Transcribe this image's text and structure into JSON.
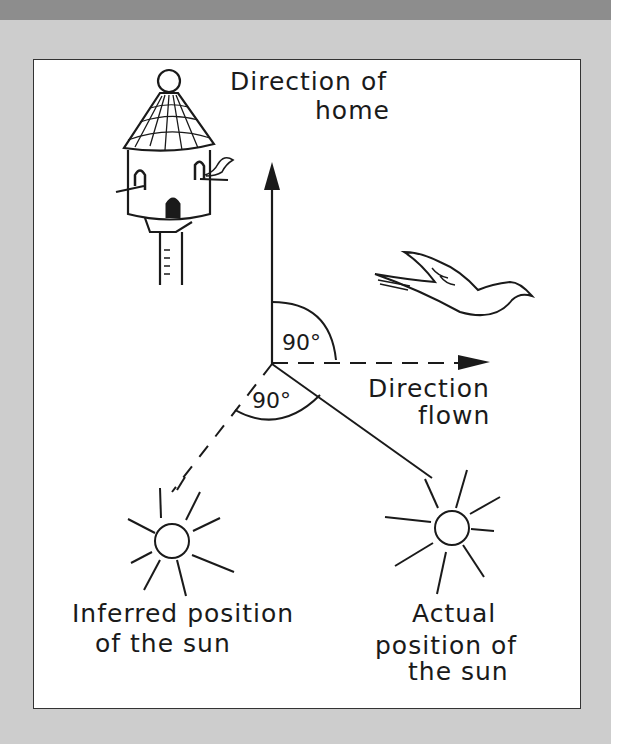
{
  "figure": {
    "labels": {
      "home_line1": "Direction of",
      "home_line2": "home",
      "flown_line1": "Direction",
      "flown_line2": "flown",
      "angle_upper": "90°",
      "angle_lower": "90°",
      "inferred_line1": "Inferred position",
      "inferred_line2": "of the sun",
      "actual_line1": "Actual",
      "actual_line2": "position of",
      "actual_line3": "the sun"
    },
    "icons": [
      "dovecote-icon",
      "flying-pigeon-icon",
      "sun-icon-inferred",
      "sun-icon-actual",
      "arrow-up-icon",
      "arrow-right-icon"
    ],
    "colors": {
      "frame_bg": "#ffffff",
      "panel_bg": "#cdcdcd",
      "top_bar": "#8d8d8d",
      "ink": "#1a1a1a"
    }
  }
}
